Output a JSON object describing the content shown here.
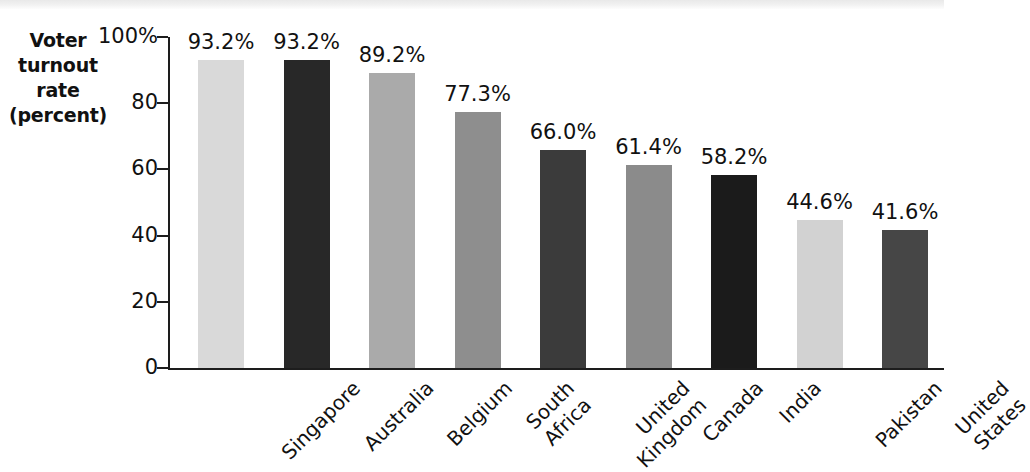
{
  "chart_data": {
    "type": "bar",
    "title": "",
    "ylabel": "Voter turnout rate (percent)",
    "xlabel": "",
    "ylim": [
      0,
      100
    ],
    "ytick_labels": [
      "100%",
      "80",
      "60",
      "40",
      "20",
      "0"
    ],
    "ytick_values": [
      100,
      80,
      60,
      40,
      20,
      0
    ],
    "grid": false,
    "legend": "none",
    "categories": [
      "Singapore",
      "Australia",
      "Belgium",
      "South Africa",
      "United Kingdom",
      "Canada",
      "India",
      "Pakistan",
      "United States"
    ],
    "values": [
      93.2,
      93.2,
      89.2,
      77.3,
      66.0,
      61.4,
      58.2,
      44.6,
      41.6
    ],
    "value_labels": [
      "93.2%",
      "93.2%",
      "89.2%",
      "77.3%",
      "66.0%",
      "61.4%",
      "58.2%",
      "44.6%",
      "41.6%"
    ],
    "bar_colors": [
      "#d9d9d9",
      "#282828",
      "#aaaaaa",
      "#8e8e8e",
      "#3b3b3b",
      "#8b8b8b",
      "#1b1b1b",
      "#d2d2d2",
      "#464646"
    ]
  },
  "axis_title": {
    "line1": "Voter",
    "line2": "turnout",
    "line3": "rate",
    "line4": "(percent)"
  },
  "category_label_lines": [
    [
      "Singapore"
    ],
    [
      "Australia"
    ],
    [
      "Belgium"
    ],
    [
      "South",
      "Africa"
    ],
    [
      "United",
      "Kingdom"
    ],
    [
      "Canada"
    ],
    [
      "India"
    ],
    [
      "Pakistan"
    ],
    [
      "United",
      "States"
    ]
  ],
  "colors": {
    "axis": "#1d1d1d",
    "text": "#111111",
    "background": "#ffffff"
  }
}
